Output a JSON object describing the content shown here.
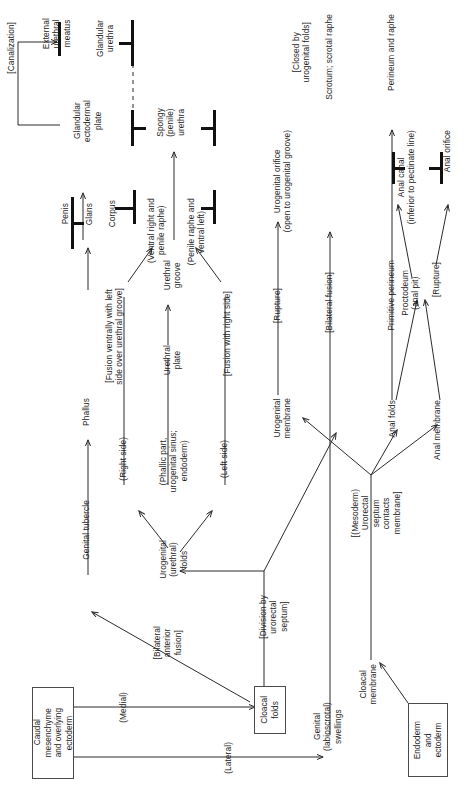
{
  "figure": {
    "orientation": "text rotated 90 degrees counter-clockwise",
    "line_color": "#2b2b2b",
    "box_border_color": "#4a4a4a",
    "background": "#ffffff"
  },
  "nodes": {
    "caudal_mesenchyme": "Caudal\nmesenchyme\nand overlying\nectoderm",
    "endoderm_ectoderm": "Endoderm\nand\nectoderm",
    "cloacal_folds": "Cloacal\nfolds",
    "genital_tubercle": "Genital tubercle",
    "phallus": "Phallus",
    "urogenital_folds": "Urogenital\n(urethral)\nfolds",
    "genital_swellings": "Genital\n(labioscrotal)\nswellings",
    "cloacal_membrane": "Cloacal\nmembrane",
    "urogenital_membrane": "Urogenital\nmembrane",
    "anal_folds": "Anal folds",
    "anal_membrane": "Anal membrane",
    "right_side": "(Right side)",
    "left_side": "(Left side)",
    "phallic_part": "(Phallic part,\nurogenital sinus;\nendoderm)",
    "urethral_plate": "Urethral\nplate",
    "urethral_groove": "Urethral\ngroove",
    "ventral_right": "(Ventral right and\npenile raphe)",
    "penile_raphe": "(Penile raphe and\nventral left)",
    "corpus": "Corpus",
    "glans": "Glans",
    "penis": "Penis",
    "glandular_ectodermal_plate": "Glandular\nectodermal\nplate",
    "external_urethral_meatus": "External\nurethral\nmeatus",
    "glandular_urethra": "Glandular\nurethra",
    "spongy_urethra": "Spongy\n(penile)\nurethra",
    "urogenital_orifice": "Urogenital orifice\n(open to urogenital groove)",
    "scrotum": "Scrotum; scrotal raphe",
    "primitive_perineum": "Primitive perineum",
    "perineum_raphe": "Perineum and raphe",
    "proctodeum": "Proctodeum\n(anal pit)",
    "anal_canal": "Anal canal\n(inferior to pectinate line)",
    "anal_orifice": "Anal orifice"
  },
  "edge_labels": {
    "medial": "(Medial)",
    "lateral": "(Lateral)",
    "bilateral_anterior_fusion": "[Bilateral\nanterior\nfusion]",
    "division_by_urorectal_septum": "[Division by\nurorectal\nseptum]",
    "mesoderm_urorectal_septum": "[(Mesoderm)\nUrorectal\nseptum\ncontacts\nmembrane]",
    "fusion_ventrally_left": "[Fusion ventrally with left\nside over urethral groove]",
    "fusion_with_right_side": "[Fusion with right side]",
    "canalization": "[Canalization]",
    "rupture_ug": "[Rupture]",
    "rupture_anal": "[Rupture]",
    "bilateral_fusion": "[Bilateral fusion]",
    "closed_by_urogenital_folds": "[Closed by\nurogenital folds]"
  }
}
